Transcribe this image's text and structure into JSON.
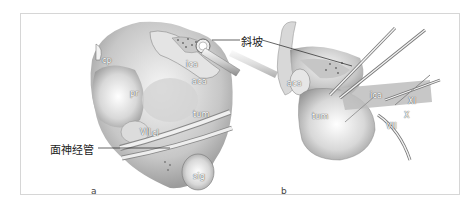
{
  "figure": {
    "panels": [
      {
        "id": "a",
        "label": "a",
        "structures": {
          "cp": "cp",
          "ica": "ica",
          "aca": "aca",
          "pr": "pr",
          "tum": "tum",
          "vii": "VII",
          "cl": "cl",
          "sig": "sig"
        },
        "callout": "面神经管"
      },
      {
        "id": "b",
        "label": "b",
        "structures": {
          "aca": "aca",
          "ica": "ica",
          "tum": "tum",
          "vii": "VII",
          "x": "X",
          "xi": "XI"
        }
      }
    ],
    "shared_callout": "斜坡"
  }
}
